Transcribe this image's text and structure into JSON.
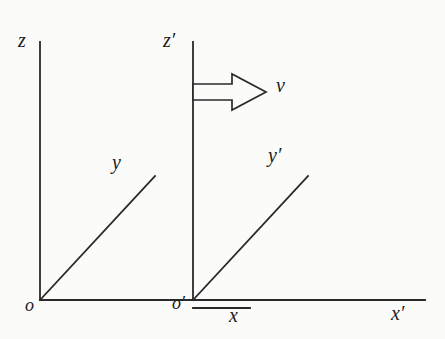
{
  "figure": {
    "background_color": "#fbfbfa",
    "stroke_color": "#2a2a2a",
    "text_color": "#1c1c1c"
  },
  "labels": {
    "z": "z",
    "z_prime": "z′",
    "y": "y",
    "y_prime": "y′",
    "x": "x",
    "x_prime": "x′",
    "origin": "o",
    "origin_prime": "o′",
    "velocity": "v"
  },
  "geometry": {
    "unprimed_frame": {
      "origin": [
        40,
        300
      ],
      "z_axis_top": [
        40,
        42
      ],
      "y_axis_end": [
        155,
        176
      ],
      "x_axis_end": [
        425,
        300
      ]
    },
    "primed_frame": {
      "origin": [
        193,
        300
      ],
      "z_axis_top": [
        193,
        42
      ],
      "y_axis_end": [
        308,
        176
      ],
      "x_axis_short_end": [
        250,
        308
      ]
    },
    "velocity_arrow": {
      "shaft_start": [
        193,
        92
      ],
      "tip": [
        266,
        92
      ],
      "style": "outline-block-arrow",
      "direction": "right"
    }
  }
}
